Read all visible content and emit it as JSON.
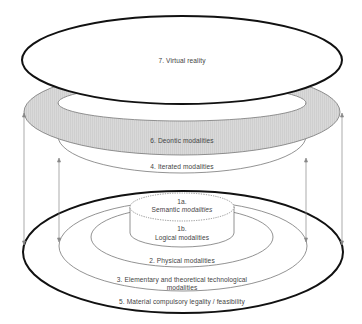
{
  "diagram": {
    "type": "nested-ellipse-layers",
    "colors": {
      "stroke_main": "#111111",
      "stroke_thin": "#777777",
      "band_fill": "#d6d6d6",
      "background": "#ffffff",
      "text": "#444444"
    },
    "layers": {
      "l7": {
        "label": "7. Virtual reality"
      },
      "l6": {
        "label": "6. Deontic modalities"
      },
      "l4": {
        "label": "4. Iterated modalities"
      },
      "l1a": {
        "number": "1a.",
        "label_plain": "Semantic",
        "label_italic": "modalities"
      },
      "l1b": {
        "number": "1b.",
        "label": "Logical modalities"
      },
      "l2": {
        "label": "2. Physical modalities"
      },
      "l3": {
        "line1": "3. Elementary and theoretical technological",
        "line2": "modalities"
      },
      "l5": {
        "label": "5. Material compulsory legality / feasibility"
      }
    }
  }
}
